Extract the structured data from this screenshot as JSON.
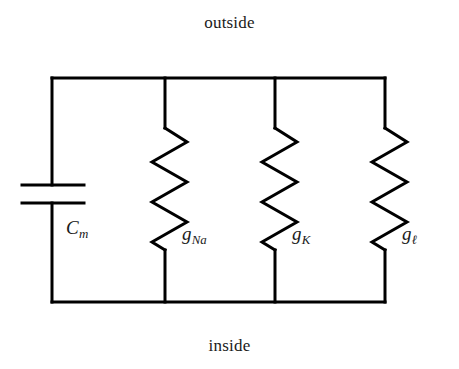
{
  "figure": {
    "background_color": "#ffffff",
    "line_color": "#000000",
    "text_color": "#1a1a1a"
  },
  "rails": {
    "top_label": "outside",
    "bottom_label": "inside"
  },
  "branches": [
    {
      "id": "capacitor",
      "type": "capacitor",
      "label_main": "C",
      "label_sub": "m",
      "x": 52
    },
    {
      "id": "sodium-conductance",
      "type": "resistor",
      "label_main": "g",
      "label_sub": "Na",
      "x": 165
    },
    {
      "id": "potassium-conductance",
      "type": "resistor",
      "label_main": "g",
      "label_sub": "K",
      "x": 275
    },
    {
      "id": "leak-conductance",
      "type": "resistor",
      "label_main": "g",
      "label_sub": "ℓ",
      "x": 385
    }
  ]
}
